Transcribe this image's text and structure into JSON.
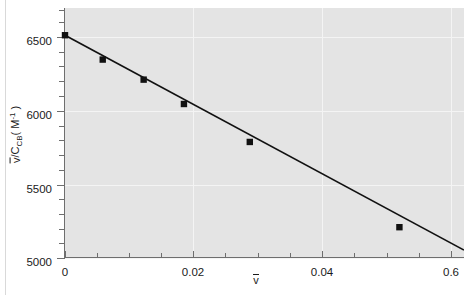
{
  "figure": {
    "background_color": "#ffffff",
    "plot_background_color": "#e4e4e4",
    "grid_color": "#f4f4f4",
    "axis_color": "#6e6e6e",
    "series_color": "#111111"
  },
  "axes": {
    "x": {
      "label_main": "v",
      "label_overbar": true,
      "tick_labels": [
        "0",
        "0.02",
        "0.04",
        "0.6"
      ],
      "tick_values": [
        0,
        0.02,
        0.04,
        0.06
      ],
      "minor_ticks_per_major": 4,
      "range": [
        0,
        0.0624
      ]
    },
    "y": {
      "label_numerator": "v",
      "label_denominator": "C",
      "label_denominator_sub": "CB",
      "label_units_open": "( M",
      "label_units_exp": "-1",
      "label_units_close": " )",
      "label_full": "v/C_CB ( M^-1 )",
      "tick_labels": [
        "6500",
        "6000",
        "5500",
        "5000"
      ],
      "tick_values": [
        6500,
        6000,
        5500,
        5000
      ],
      "minor_ticks_per_major": 5,
      "range": [
        4945,
        6690
      ]
    }
  },
  "chart_data": {
    "type": "scatter",
    "title": "",
    "xlabel": "v̄",
    "ylabel": "v̄/C_CB ( M⁻¹ )",
    "xlim": [
      0,
      0.0624
    ],
    "ylim": [
      4945,
      6690
    ],
    "grid": true,
    "legend": false,
    "series": [
      {
        "name": "Scatchard data",
        "marker": "square",
        "marker_color": "#111111",
        "x": [
          0.0,
          0.0059,
          0.0123,
          0.0186,
          0.0289,
          0.0523
        ],
        "y": [
          6500,
          6330,
          6190,
          6020,
          5755,
          5160
        ]
      },
      {
        "name": "Linear fit",
        "type": "line",
        "line_color": "#111111",
        "x": [
          0.0,
          0.0624
        ],
        "y": [
          6500,
          5000
        ]
      }
    ]
  }
}
